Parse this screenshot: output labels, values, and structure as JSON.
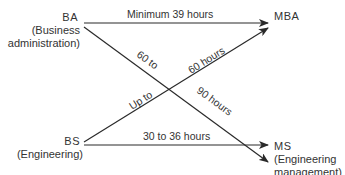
{
  "nodes": {
    "ba": {
      "title": "BA",
      "subtitle_line1": "(Business",
      "subtitle_line2": "administration)"
    },
    "bs": {
      "title": "BS",
      "subtitle_line1": "(Engineering)"
    },
    "mba": {
      "title": "MBA"
    },
    "ms": {
      "title": "MS",
      "subtitle_line1": "(Engineering",
      "subtitle_line2": "management)"
    }
  },
  "edges": [
    {
      "from": "BA",
      "to": "MBA",
      "label": "Minimum 39 hours"
    },
    {
      "from": "BA",
      "to": "MS",
      "label_part1": "60 to",
      "label_part2": "90 hours"
    },
    {
      "from": "BS",
      "to": "MBA",
      "label_part1": "Up to",
      "label_part2": "60 hours"
    },
    {
      "from": "BS",
      "to": "MS",
      "label": "30 to 36 hours"
    }
  ],
  "colors": {
    "line": "#2a2a2a",
    "text": "#333333",
    "background": "#ffffff"
  }
}
